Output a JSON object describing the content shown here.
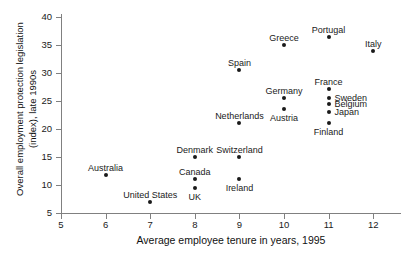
{
  "chart_data": {
    "type": "scatter",
    "title": "",
    "xlabel": "Average employee tenure in years, 1995",
    "ylabel_lines": [
      "Overall employment protection legislation",
      "(index), late 1990s"
    ],
    "ylabel": "Overall employment protection legislation (index), late 1990s",
    "xlim": [
      5,
      12.35
    ],
    "ylim": [
      5,
      40
    ],
    "xticks": [
      5,
      6,
      7,
      8,
      9,
      10,
      11,
      12
    ],
    "yticks": [
      5,
      10,
      15,
      20,
      25,
      30,
      35,
      40
    ],
    "grid": false,
    "legend": "none",
    "marker_color": "#1a1a1a",
    "axis_color": "#808080",
    "points": [
      {
        "name": "Australia",
        "x": 6,
        "y": 11.8,
        "label_dx": 0,
        "label_dy": -12,
        "align": "center"
      },
      {
        "name": "United States",
        "x": 7,
        "y": 7.0,
        "label_dx": 0,
        "label_dy": -12,
        "align": "center"
      },
      {
        "name": "Denmark",
        "x": 8,
        "y": 15.0,
        "label_dx": 0,
        "label_dy": -12,
        "align": "center"
      },
      {
        "name": "Canada",
        "x": 8,
        "y": 11.0,
        "label_dx": 0,
        "label_dy": -12,
        "align": "center"
      },
      {
        "name": "UK",
        "x": 8,
        "y": 9.5,
        "label_dx": 0,
        "label_dy": 4,
        "align": "center"
      },
      {
        "name": "Switzerland",
        "x": 9,
        "y": 15.0,
        "label_dx": 0,
        "label_dy": -12,
        "align": "center"
      },
      {
        "name": "Ireland",
        "x": 9,
        "y": 11.0,
        "label_dx": 0,
        "label_dy": 4,
        "align": "center"
      },
      {
        "name": "Netherlands",
        "x": 9,
        "y": 21.0,
        "label_dx": 0,
        "label_dy": -12,
        "align": "center"
      },
      {
        "name": "Spain",
        "x": 9,
        "y": 30.5,
        "label_dx": 0,
        "label_dy": -12,
        "align": "center"
      },
      {
        "name": "Austria",
        "x": 10,
        "y": 23.5,
        "label_dx": 0,
        "label_dy": 4,
        "align": "center"
      },
      {
        "name": "Germany",
        "x": 10,
        "y": 25.5,
        "label_dx": 0,
        "label_dy": -12,
        "align": "center"
      },
      {
        "name": "Greece",
        "x": 10,
        "y": 35.0,
        "label_dx": 0,
        "label_dy": -12,
        "align": "center"
      },
      {
        "name": "Finland",
        "x": 11,
        "y": 21.0,
        "label_dx": 0,
        "label_dy": 4,
        "align": "center"
      },
      {
        "name": "Japan",
        "x": 11,
        "y": 23.0,
        "label_dx": 6,
        "label_dy": -5,
        "align": "left"
      },
      {
        "name": "Belgium",
        "x": 11,
        "y": 24.5,
        "label_dx": 6,
        "label_dy": -5,
        "align": "left"
      },
      {
        "name": "Sweden",
        "x": 11,
        "y": 25.6,
        "label_dx": 6,
        "label_dy": -5,
        "align": "left"
      },
      {
        "name": "France",
        "x": 11,
        "y": 27.2,
        "label_dx": 0,
        "label_dy": -12,
        "align": "center"
      },
      {
        "name": "Portugal",
        "x": 11,
        "y": 36.5,
        "label_dx": 0,
        "label_dy": -12,
        "align": "center"
      },
      {
        "name": "Italy",
        "x": 12,
        "y": 34.0,
        "label_dx": 0,
        "label_dy": -12,
        "align": "center"
      }
    ]
  }
}
